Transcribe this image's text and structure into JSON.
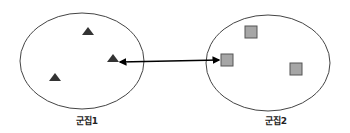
{
  "diagram": {
    "clusters": [
      {
        "name": "군집1",
        "marker_shape": "triangle",
        "marker_color": "#333333",
        "point_count": 3
      },
      {
        "name": "군집2",
        "marker_shape": "square",
        "marker_color": "#a6a6a6",
        "marker_stroke": "#555555",
        "point_count": 3
      }
    ],
    "connector": {
      "type": "double-headed-arrow",
      "from": "군집1",
      "to": "군집2",
      "color": "#000000"
    },
    "ellipse_stroke": "#444444"
  }
}
